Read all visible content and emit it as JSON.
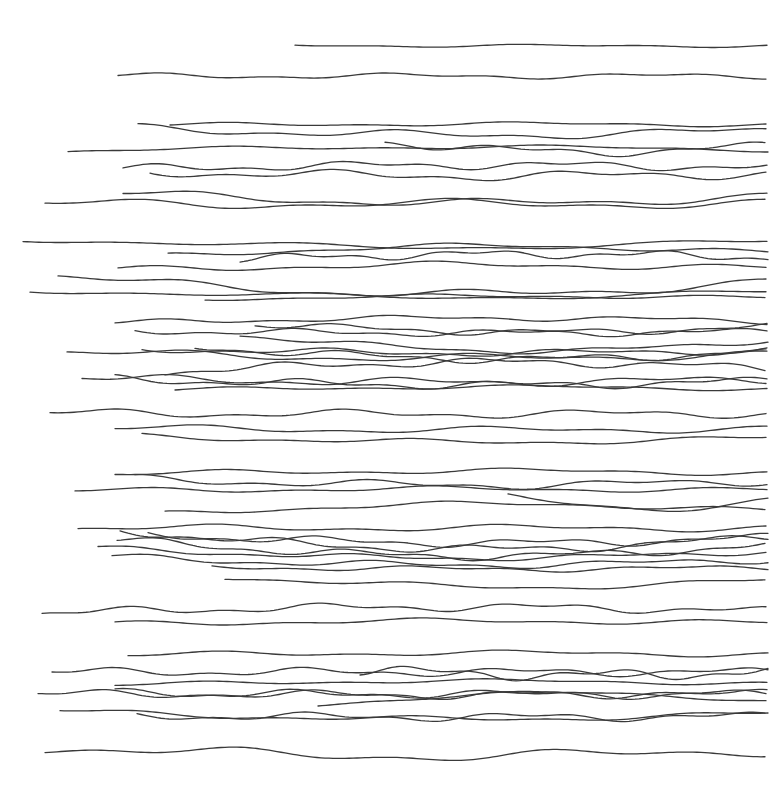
{
  "artwork": {
    "background": "#ffffff",
    "stroke_color": "#3a3a3a",
    "stroke_width": 1.3,
    "right_edge": 768,
    "lines": [
      {
        "x0": 295,
        "y": 45,
        "amp": 1.2,
        "freq": 0.02,
        "phase": 0.0,
        "drift": 1
      },
      {
        "x0": 118,
        "y": 76,
        "amp": 2.0,
        "freq": 0.025,
        "phase": 1.0,
        "drift": 0
      },
      {
        "x0": 170,
        "y": 125,
        "amp": 1.5,
        "freq": 0.02,
        "phase": 0.3,
        "drift": -1
      },
      {
        "x0": 138,
        "y": 128,
        "amp": 3.0,
        "freq": 0.022,
        "phase": 2.1,
        "drift": 7
      },
      {
        "x0": 68,
        "y": 151,
        "amp": 1.5,
        "freq": 0.018,
        "phase": 0.8,
        "drift": -4
      },
      {
        "x0": 385,
        "y": 142,
        "amp": 3.0,
        "freq": 0.03,
        "phase": 1.7,
        "drift": 10
      },
      {
        "x0": 123,
        "y": 169,
        "amp": 3.0,
        "freq": 0.03,
        "phase": 0.2,
        "drift": -4
      },
      {
        "x0": 150,
        "y": 172,
        "amp": 3.5,
        "freq": 0.025,
        "phase": 2.6,
        "drift": 4
      },
      {
        "x0": 123,
        "y": 193,
        "amp": 3.0,
        "freq": 0.02,
        "phase": 1.1,
        "drift": 10
      },
      {
        "x0": 45,
        "y": 204,
        "amp": 3.5,
        "freq": 0.018,
        "phase": 2.9,
        "drift": 0
      },
      {
        "x0": 23,
        "y": 239,
        "amp": 2.0,
        "freq": 0.015,
        "phase": 0.4,
        "drift": 8
      },
      {
        "x0": 168,
        "y": 256,
        "amp": 2.0,
        "freq": 0.02,
        "phase": 1.9,
        "drift": -10
      },
      {
        "x0": 240,
        "y": 259,
        "amp": 3.0,
        "freq": 0.035,
        "phase": 0.6,
        "drift": -5
      },
      {
        "x0": 118,
        "y": 270,
        "amp": 2.5,
        "freq": 0.02,
        "phase": 2.2,
        "drift": -5
      },
      {
        "x0": 58,
        "y": 276,
        "amp": 3.0,
        "freq": 0.02,
        "phase": 1.4,
        "drift": 18
      },
      {
        "x0": 30,
        "y": 290,
        "amp": 2.0,
        "freq": 0.015,
        "phase": 0.1,
        "drift": 7
      },
      {
        "x0": 205,
        "y": 299,
        "amp": 1.5,
        "freq": 0.02,
        "phase": 2.4,
        "drift": -3
      },
      {
        "x0": 115,
        "y": 323,
        "amp": 2.0,
        "freq": 0.025,
        "phase": 0.9,
        "drift": -5
      },
      {
        "x0": 135,
        "y": 331,
        "amp": 2.5,
        "freq": 0.03,
        "phase": 2.0,
        "drift": 2
      },
      {
        "x0": 255,
        "y": 324,
        "amp": 2.5,
        "freq": 0.03,
        "phase": 0.5,
        "drift": 8
      },
      {
        "x0": 240,
        "y": 335,
        "amp": 2.0,
        "freq": 0.025,
        "phase": 1.6,
        "drift": 16
      },
      {
        "x0": 142,
        "y": 349,
        "amp": 2.5,
        "freq": 0.025,
        "phase": 2.8,
        "drift": 4
      },
      {
        "x0": 195,
        "y": 347,
        "amp": 3.0,
        "freq": 0.03,
        "phase": 0.3,
        "drift": 12
      },
      {
        "x0": 67,
        "y": 352,
        "amp": 3.0,
        "freq": 0.02,
        "phase": 1.3,
        "drift": 6
      },
      {
        "x0": 165,
        "y": 372,
        "amp": 3.0,
        "freq": 0.03,
        "phase": 2.5,
        "drift": -10
      },
      {
        "x0": 82,
        "y": 378,
        "amp": 3.0,
        "freq": 0.025,
        "phase": 0.7,
        "drift": 4
      },
      {
        "x0": 115,
        "y": 379,
        "amp": 3.0,
        "freq": 0.03,
        "phase": 1.8,
        "drift": 6
      },
      {
        "x0": 175,
        "y": 390,
        "amp": 1.5,
        "freq": 0.02,
        "phase": 0.2,
        "drift": -3
      },
      {
        "x0": 50,
        "y": 413,
        "amp": 3.0,
        "freq": 0.025,
        "phase": 2.3,
        "drift": 1
      },
      {
        "x0": 115,
        "y": 428,
        "amp": 2.5,
        "freq": 0.02,
        "phase": 1.0,
        "drift": 2
      },
      {
        "x0": 142,
        "y": 436,
        "amp": 2.0,
        "freq": 0.02,
        "phase": 2.7,
        "drift": 6
      },
      {
        "x0": 115,
        "y": 474,
        "amp": 2.0,
        "freq": 0.02,
        "phase": 0.4,
        "drift": -3
      },
      {
        "x0": 135,
        "y": 479,
        "amp": 3.0,
        "freq": 0.025,
        "phase": 1.5,
        "drift": 6
      },
      {
        "x0": 75,
        "y": 491,
        "amp": 2.0,
        "freq": 0.02,
        "phase": 2.2,
        "drift": -2
      },
      {
        "x0": 508,
        "y": 497,
        "amp": 2.5,
        "freq": 0.02,
        "phase": 0.8,
        "drift": 11
      },
      {
        "x0": 165,
        "y": 514,
        "amp": 2.0,
        "freq": 0.02,
        "phase": 1.9,
        "drift": -10
      },
      {
        "x0": 78,
        "y": 528,
        "amp": 2.5,
        "freq": 0.02,
        "phase": 0.6,
        "drift": 0
      },
      {
        "x0": 120,
        "y": 531,
        "amp": 3.0,
        "freq": 0.03,
        "phase": 2.6,
        "drift": 18
      },
      {
        "x0": 148,
        "y": 535,
        "amp": 3.0,
        "freq": 0.03,
        "phase": 1.2,
        "drift": 8
      },
      {
        "x0": 117,
        "y": 540,
        "amp": 3.0,
        "freq": 0.03,
        "phase": 0.1,
        "drift": 16
      },
      {
        "x0": 98,
        "y": 548,
        "amp": 2.0,
        "freq": 0.025,
        "phase": 2.0,
        "drift": 10
      },
      {
        "x0": 112,
        "y": 557,
        "amp": 2.5,
        "freq": 0.025,
        "phase": 1.4,
        "drift": 8
      },
      {
        "x0": 212,
        "y": 567,
        "amp": 2.0,
        "freq": 0.025,
        "phase": 0.3,
        "drift": 2
      },
      {
        "x0": 225,
        "y": 577,
        "amp": 2.0,
        "freq": 0.02,
        "phase": 2.8,
        "drift": 10
      },
      {
        "x0": 42,
        "y": 613,
        "amp": 3.0,
        "freq": 0.03,
        "phase": 1.1,
        "drift": -6
      },
      {
        "x0": 115,
        "y": 624,
        "amp": 2.0,
        "freq": 0.02,
        "phase": 2.5,
        "drift": -3
      },
      {
        "x0": 128,
        "y": 655,
        "amp": 2.0,
        "freq": 0.02,
        "phase": 0.5,
        "drift": -2
      },
      {
        "x0": 52,
        "y": 672,
        "amp": 3.0,
        "freq": 0.03,
        "phase": 1.7,
        "drift": 0
      },
      {
        "x0": 360,
        "y": 670,
        "amp": 4.0,
        "freq": 0.035,
        "phase": 2.4,
        "drift": 5
      },
      {
        "x0": 115,
        "y": 685,
        "amp": 1.5,
        "freq": 0.02,
        "phase": 0.9,
        "drift": -4
      },
      {
        "x0": 38,
        "y": 694,
        "amp": 3.0,
        "freq": 0.03,
        "phase": 2.1,
        "drift": 0
      },
      {
        "x0": 115,
        "y": 693,
        "amp": 3.0,
        "freq": 0.03,
        "phase": 1.3,
        "drift": 2
      },
      {
        "x0": 318,
        "y": 705,
        "amp": 1.5,
        "freq": 0.02,
        "phase": 0.2,
        "drift": -12
      },
      {
        "x0": 60,
        "y": 711,
        "amp": 2.0,
        "freq": 0.02,
        "phase": 2.7,
        "drift": 8
      },
      {
        "x0": 137,
        "y": 716,
        "amp": 3.0,
        "freq": 0.03,
        "phase": 1.6,
        "drift": 1
      },
      {
        "x0": 45,
        "y": 748,
        "amp": 4.0,
        "freq": 0.018,
        "phase": 0.6,
        "drift": 8
      }
    ]
  }
}
